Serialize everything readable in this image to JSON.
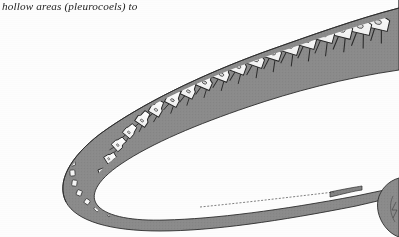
{
  "page": {
    "background_color": "#fdfdfd",
    "width": 399,
    "height": 237
  },
  "caption": {
    "text": "hollow areas (pleurocoels) to",
    "style": "italic-serif",
    "color": "#1d1d1d"
  },
  "figure": {
    "name": "sauropod-neck-vertebrae-illustration",
    "colors": {
      "soft_tissue_gray": "#8b8b8b",
      "soft_tissue_gray_dark": "#787878",
      "bone_fill": "#fbfbfb",
      "outline": "#2a2a2a",
      "hatch": "#5e5e5e"
    },
    "elements": {
      "neck_band_label": "neck soft-tissue envelope",
      "vertebra_label": "cervical vertebra",
      "neural_spine_label": "neural spine",
      "centrum_label": "centrum",
      "pleurocoel_label": "pleurocoel (hollow area)",
      "cervical_rib_label": "cervical rib",
      "tail_taper_label": "tapering distal segment",
      "body_mass_label": "body mass at right edge"
    },
    "vertebra_count_visible": 22,
    "pleurocoel_count_visible": 14
  }
}
